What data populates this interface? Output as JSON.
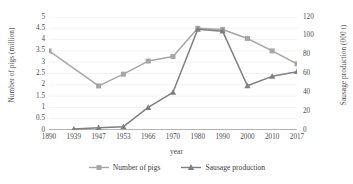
{
  "chart_data": {
    "type": "line",
    "title": "",
    "xlabel": "year",
    "categories": [
      "1890",
      "1939",
      "1947",
      "1953",
      "1966",
      "1970",
      "1980",
      "1990",
      "2000",
      "2010",
      "2017"
    ],
    "grid": true,
    "legend_position": "bottom",
    "axes": {
      "left": {
        "label": "Number of pigs (million)",
        "ylim": [
          0,
          5
        ],
        "ticks": [
          "0",
          "0.5",
          "1",
          "1.5",
          "2",
          "2.5",
          "3",
          "3.5",
          "4",
          "4.5",
          "5"
        ],
        "tick_values": [
          0,
          0.5,
          1,
          1.5,
          2,
          2.5,
          3,
          3.5,
          4,
          4.5,
          5
        ]
      },
      "right": {
        "label": "Sausage production (000 t)",
        "ylim": [
          0,
          120
        ],
        "ticks": [
          "0",
          "20",
          "40",
          "60",
          "80",
          "100",
          "120"
        ],
        "tick_values": [
          0,
          20,
          40,
          60,
          80,
          100,
          120
        ]
      }
    },
    "series": [
      {
        "name": "Number of pigs",
        "axis": "left",
        "color": "#a6a6a6",
        "marker": "square",
        "x": [
          "1890",
          "1947",
          "1953",
          "1966",
          "1970",
          "1980",
          "1990",
          "2000",
          "2010",
          "2017"
        ],
        "values": [
          3.5,
          1.95,
          2.47,
          3.05,
          3.25,
          4.5,
          4.45,
          4.05,
          3.5,
          2.93
        ]
      },
      {
        "name": "Sausage production",
        "axis": "right",
        "color": "#7f7f7f",
        "marker": "triangle",
        "x": [
          "1939",
          "1947",
          "1953",
          "1966",
          "1970",
          "1980",
          "1990",
          "2000",
          "2010",
          "2017"
        ],
        "values": [
          1,
          2.5,
          3.5,
          24,
          40,
          107,
          105,
          47,
          57,
          62
        ]
      }
    ]
  },
  "legend": {
    "items": [
      {
        "label": "Number of pigs"
      },
      {
        "label": "Sausage production"
      }
    ]
  }
}
